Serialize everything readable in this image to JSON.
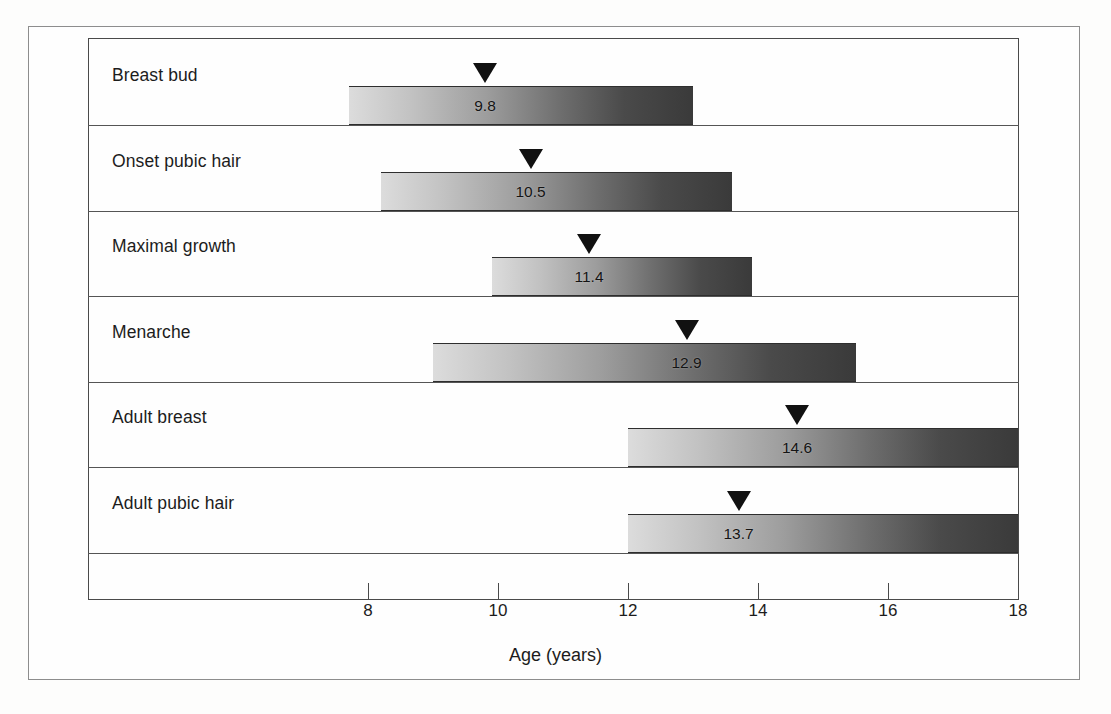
{
  "chart_data": {
    "type": "bar",
    "title": "",
    "subtitle": "",
    "xlabel": "Age (years)",
    "ylabel": "",
    "xlim": [
      7.0,
      18.0
    ],
    "xticks": [
      8,
      10,
      12,
      14,
      16,
      18
    ],
    "xticklabels": [
      "8",
      "10",
      "12",
      "14",
      "16",
      "18"
    ],
    "grid": false,
    "legend": null,
    "orientation": "horizontal",
    "bar_style": "range-bar-with-mean-marker",
    "categories": [
      "Breast bud",
      "Onset pubic hair",
      "Maximal growth",
      "Menarche",
      "Adult breast",
      "Adult pubic hair"
    ],
    "series": [
      {
        "name": "range_start",
        "values": [
          7.7,
          8.2,
          9.9,
          9.0,
          12.0,
          12.0
        ]
      },
      {
        "name": "range_end",
        "values": [
          13.0,
          13.6,
          13.9,
          15.5,
          18.0,
          18.0
        ]
      },
      {
        "name": "mean_marker",
        "values": [
          9.8,
          10.5,
          11.4,
          12.9,
          14.6,
          13.7
        ]
      }
    ],
    "rows": [
      {
        "label": "Breast bud",
        "start": 7.7,
        "end": 13.0,
        "marker": 9.8,
        "marker_label": "9.8"
      },
      {
        "label": "Onset pubic hair",
        "start": 8.2,
        "end": 13.6,
        "marker": 10.5,
        "marker_label": "10.5"
      },
      {
        "label": "Maximal growth",
        "start": 9.9,
        "end": 13.9,
        "marker": 11.4,
        "marker_label": "11.4"
      },
      {
        "label": "Menarche",
        "start": 9.0,
        "end": 15.5,
        "marker": 12.9,
        "marker_label": "12.9"
      },
      {
        "label": "Adult breast",
        "start": 12.0,
        "end": 18.0,
        "marker": 14.6,
        "marker_label": "14.6"
      },
      {
        "label": "Adult pubic hair",
        "start": 12.0,
        "end": 18.0,
        "marker": 13.7,
        "marker_label": "13.7"
      }
    ],
    "colors": {
      "bar_gradient_light": "#dcdcdc",
      "bar_gradient_dark": "#3a3a3a",
      "marker": "#111111",
      "axis": "#4a4a4a",
      "text": "#1c1c1c",
      "background": "#fefefe"
    }
  }
}
